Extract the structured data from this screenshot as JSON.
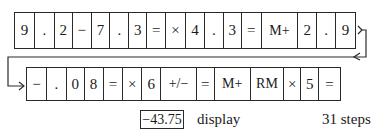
{
  "keystroke_rows": [
    {
      "keys": [
        {
          "label": "9",
          "w": 20
        },
        {
          "label": ".",
          "w": 20
        },
        {
          "label": "2",
          "w": 18
        },
        {
          "label": "−",
          "w": 19
        },
        {
          "label": "7",
          "w": 19
        },
        {
          "label": ".",
          "w": 19
        },
        {
          "label": "3",
          "w": 18
        },
        {
          "label": "=",
          "w": 19
        },
        {
          "label": "×",
          "w": 20
        },
        {
          "label": "4",
          "w": 19
        },
        {
          "label": ".",
          "w": 19
        },
        {
          "label": "3",
          "w": 18
        },
        {
          "label": "=",
          "w": 20
        },
        {
          "label": "M+",
          "w": 37
        },
        {
          "label": "2",
          "w": 19
        },
        {
          "label": ".",
          "w": 19
        },
        {
          "label": "9",
          "w": 19
        }
      ]
    },
    {
      "keys": [
        {
          "label": "−",
          "w": 20
        },
        {
          "label": ".",
          "w": 20
        },
        {
          "label": "0",
          "w": 18
        },
        {
          "label": "8",
          "w": 19
        },
        {
          "label": "=",
          "w": 20
        },
        {
          "label": "×",
          "w": 19
        },
        {
          "label": "6",
          "w": 19
        },
        {
          "label": "+/−",
          "w": 36
        },
        {
          "label": "=",
          "w": 18
        },
        {
          "label": "M+",
          "w": 36
        },
        {
          "label": "RM",
          "w": 34
        },
        {
          "label": "×",
          "w": 17
        },
        {
          "label": "5",
          "w": 18
        },
        {
          "label": "=",
          "w": 21
        }
      ]
    }
  ],
  "result": {
    "display_value": "−43.75",
    "display_label": "display",
    "step_count": "31 steps"
  }
}
